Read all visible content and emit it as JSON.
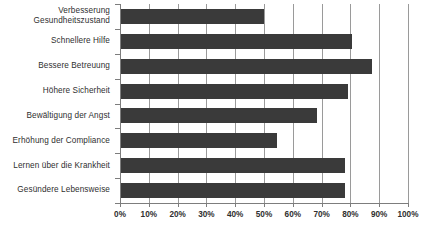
{
  "chart_data": {
    "type": "bar",
    "orientation": "horizontal",
    "title": "",
    "xlabel": "",
    "ylabel": "",
    "xlim": [
      0,
      100
    ],
    "grid": true,
    "legend": false,
    "tick_suffix": "%",
    "categories": [
      "Verbesserung\nGesundheitszustand",
      "Schnellere Hilfe",
      "Bessere Betreuung",
      "Höhere Sicherheit",
      "Bewältigung der Angst",
      "Erhöhung der Compliance",
      "Lernen über die Krankheit",
      "Gesündere Lebensweise"
    ],
    "category_lines": [
      [
        "Verbesserung",
        "Gesundheitszustand"
      ],
      [
        "Schnellere Hilfe"
      ],
      [
        "Bessere Betreuung"
      ],
      [
        "Höhere Sicherheit"
      ],
      [
        "Bewältigung der Angst"
      ],
      [
        "Erhöhung der Compliance"
      ],
      [
        "Lernen über die Krankheit"
      ],
      [
        "Gesündere Lebensweise"
      ]
    ],
    "values": [
      50,
      80.5,
      87.5,
      79,
      68.5,
      54.5,
      78,
      78
    ],
    "tick_values": [
      0,
      10,
      20,
      30,
      40,
      50,
      60,
      70,
      80,
      90,
      100
    ],
    "tick_labels": [
      "0%",
      "10%",
      "20%",
      "30%",
      "40%",
      "50%",
      "60%",
      "70%",
      "80%",
      "90%",
      "100%"
    ]
  },
  "style": {
    "bar_color": "#3a3a3a",
    "gridline_color": "#9a9a9a",
    "axis_color": "#7d7d7d",
    "text_color": "#2f2f2f",
    "background": "#ffffff"
  }
}
